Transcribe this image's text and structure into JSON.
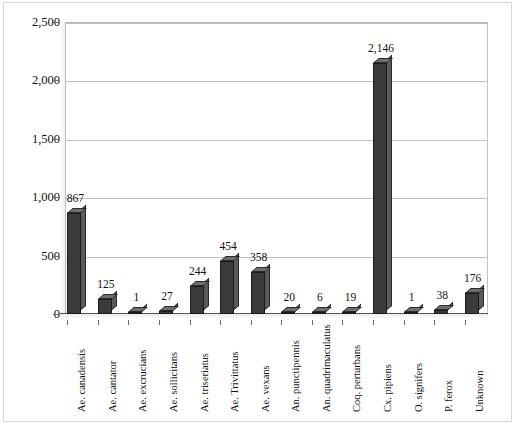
{
  "chart_data": {
    "type": "bar",
    "title": "",
    "subtitle": "",
    "xlabel": "",
    "ylabel": "",
    "ylim": [
      0,
      2500
    ],
    "yticks": [
      "0",
      "500",
      "1,000",
      "1,500",
      "2,000",
      "2,500"
    ],
    "ytick_values": [
      0,
      500,
      1000,
      1500,
      2000,
      2500
    ],
    "grid": true,
    "legend": "none",
    "style": "3d-bar",
    "bar_color": "#3b3b3b",
    "categories": [
      "Ae. canadensis",
      "Ae. cantator",
      "Ae. excrucians",
      "Ae. sollicitans",
      "Ae. triseriatus",
      "Ae. Trivittatus",
      "Ae. vexans",
      "An. punctipennis",
      "An. quadrimaculatus",
      "Coq. perturbans",
      "Cx. pipiens",
      "O. signifers",
      "P. ferox",
      "Unknown"
    ],
    "values": [
      867,
      125,
      1,
      27,
      244,
      454,
      358,
      20,
      6,
      19,
      2146,
      1,
      38,
      176
    ],
    "value_labels": [
      "867",
      "125",
      "1",
      "27",
      "244",
      "454",
      "358",
      "20",
      "6",
      "19",
      "2,146",
      "1",
      "38",
      "176"
    ]
  }
}
